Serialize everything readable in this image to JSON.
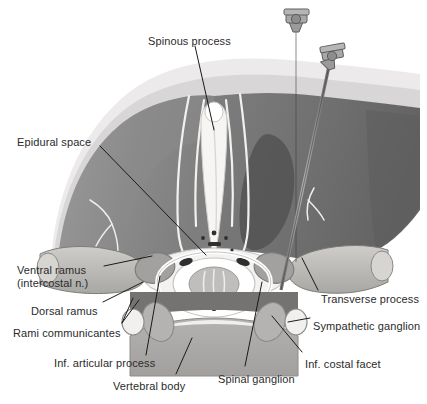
{
  "figure": {
    "type": "anatomical-illustration",
    "style": "grayscale line and tone drawing",
    "background_color": "#ffffff",
    "label_text_color": "#2b2b2b",
    "leader_line_color": "#1a1a1a"
  },
  "palette": {
    "skin_light": "#eceaea",
    "fat_layer": "#d8d6d6",
    "muscle_mid": "#8f8f8f",
    "muscle_dark": "#6f6f6f",
    "muscle_darkest": "#5c5c5c",
    "bone_light": "#f3f2f0",
    "bone_shade": "#c9c7c4",
    "cord_gray": "#b9b7b5",
    "vertebral_body": "#aaa8a6",
    "needle_steel": "#8a8a8a",
    "hub_gray": "#9a9a9a",
    "outline": "#6a6a6a",
    "white": "#ffffff"
  },
  "labels": [
    {
      "id": "spinous-process",
      "text": "Spinous process",
      "x": 148,
      "y": 35,
      "align": "left",
      "lines": 1
    },
    {
      "id": "epidural-space",
      "text": "Epidural space",
      "x": 17,
      "y": 136,
      "align": "left",
      "lines": 1
    },
    {
      "id": "ventral-ramus",
      "text": "Ventral ramus",
      "x": 17,
      "y": 264,
      "align": "left",
      "lines": 1
    },
    {
      "id": "ventral-ramus-sub",
      "text": "(intercostal n.)",
      "x": 17,
      "y": 277,
      "align": "left",
      "lines": 1
    },
    {
      "id": "dorsal-ramus",
      "text": "Dorsal ramus",
      "x": 31,
      "y": 305,
      "align": "left",
      "lines": 1
    },
    {
      "id": "rami-communicantes",
      "text": "Rami communicantes",
      "x": 13,
      "y": 327,
      "align": "left",
      "lines": 1
    },
    {
      "id": "inf-articular-process",
      "text": "Inf. articular process",
      "x": 54,
      "y": 357,
      "align": "left",
      "lines": 1
    },
    {
      "id": "vertebral-body",
      "text": "Vertebral body",
      "x": 113,
      "y": 380,
      "align": "left",
      "lines": 1
    },
    {
      "id": "spinal-ganglion",
      "text": "Spinal ganglion",
      "x": 218,
      "y": 373,
      "align": "left",
      "lines": 1
    },
    {
      "id": "inf-costal-facet",
      "text": "Inf. costal facet",
      "x": 305,
      "y": 358,
      "align": "left",
      "lines": 1
    },
    {
      "id": "sympathetic-ganglion",
      "text": "Sympathetic ganglion",
      "x": 313,
      "y": 320,
      "align": "left",
      "lines": 1
    },
    {
      "id": "transverse-process",
      "text": "Transverse process",
      "x": 321,
      "y": 293,
      "align": "left",
      "lines": 1
    }
  ],
  "structures": [
    {
      "id": "skin-fat-layer",
      "name": "Skin and subcutaneous fat layer"
    },
    {
      "id": "paraspinal-muscle-left",
      "name": "Left paraspinal muscle mass"
    },
    {
      "id": "paraspinal-muscle-right",
      "name": "Right paraspinal muscle mass"
    },
    {
      "id": "spinous-process-bone",
      "name": "Spinous process"
    },
    {
      "id": "lamina",
      "name": "Vertebral lamina"
    },
    {
      "id": "epidural-space-region",
      "name": "Epidural space"
    },
    {
      "id": "spinal-canal",
      "name": "Spinal canal with spinal cord"
    },
    {
      "id": "vertebral-body-bone",
      "name": "Vertebral body"
    },
    {
      "id": "transverse-process-left",
      "name": "Left transverse process"
    },
    {
      "id": "transverse-process-right",
      "name": "Right transverse process"
    },
    {
      "id": "rib-left",
      "name": "Left rib"
    },
    {
      "id": "rib-right",
      "name": "Right rib"
    },
    {
      "id": "spinal-ganglion-body",
      "name": "Spinal (dorsal root) ganglion"
    },
    {
      "id": "sympathetic-ganglion-body",
      "name": "Sympathetic ganglion"
    },
    {
      "id": "nerve-branches",
      "name": "Intercostal and dorsal nerve branches"
    }
  ],
  "needles": [
    {
      "id": "needle-medial",
      "name": "Medial paravertebral needle",
      "hub_x": 296,
      "hub_y": 12,
      "tip_x": 296,
      "tip_y": 262
    },
    {
      "id": "needle-lateral",
      "name": "Lateral paravertebral needle",
      "hub_x": 333,
      "hub_y": 53,
      "tip_x": 281,
      "tip_y": 290
    }
  ]
}
